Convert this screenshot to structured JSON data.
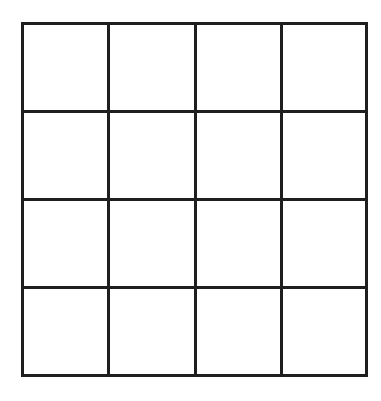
{
  "diagram": {
    "type": "grid",
    "rows": 4,
    "columns": 4,
    "cells": [
      [
        "",
        "",
        "",
        ""
      ],
      [
        "",
        "",
        "",
        ""
      ],
      [
        "",
        "",
        "",
        ""
      ],
      [
        "",
        "",
        "",
        ""
      ]
    ],
    "line_color": "#1e1e1e",
    "background": "#ffffff"
  }
}
